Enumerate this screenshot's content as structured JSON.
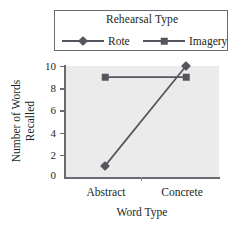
{
  "legend": {
    "title": "Rehearsal Type",
    "entries": [
      {
        "label": "Rote",
        "marker": "diamond-marker",
        "color": "#55555f"
      },
      {
        "label": "Imagery",
        "marker": "square-marker",
        "color": "#55555f"
      }
    ]
  },
  "axes": {
    "xlabel": "Word Type",
    "ylabel_line1": "Number of Words",
    "ylabel_line2": "Recalled",
    "yticks": [
      "10",
      "8",
      "6",
      "4",
      "2",
      "0"
    ],
    "xticks": [
      "Abstract",
      "Concrete"
    ]
  },
  "chart_data": {
    "type": "line",
    "title": "",
    "subtitle": "",
    "xlabel": "Word Type",
    "ylabel": "Number of Words Recalled",
    "categories": [
      "Abstract",
      "Concrete"
    ],
    "series": [
      {
        "name": "Rote",
        "values": [
          1,
          10
        ],
        "marker": "diamond",
        "color": "#55555f"
      },
      {
        "name": "Imagery",
        "values": [
          9,
          9
        ],
        "marker": "square",
        "color": "#55555f"
      }
    ],
    "ylim": [
      0,
      10
    ],
    "ytick_values": [
      0,
      2,
      4,
      6,
      8,
      10
    ],
    "grid": false,
    "legend_position": "top",
    "legend_title": "Rehearsal Type",
    "plot_background": "#ebebeb"
  }
}
